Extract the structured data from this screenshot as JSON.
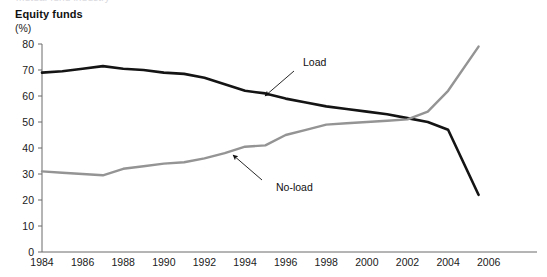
{
  "top_cut_text": "mutual fund industry",
  "chart_data": {
    "type": "line",
    "title": "Equity funds",
    "subtitle": "(%)",
    "unit_label": "(%)",
    "xlabel": "",
    "ylabel": "",
    "grid": false,
    "legend_position": "inline-annotation",
    "xlim": [
      1984,
      2007
    ],
    "ylim": [
      0,
      80
    ],
    "x_ticks": [
      1984,
      1986,
      1988,
      1990,
      1992,
      1994,
      1996,
      1998,
      2000,
      2002,
      2004,
      2006
    ],
    "x_tick_labels": [
      "1984",
      "1986",
      "1988",
      "1990",
      "1992",
      "1994",
      "1996",
      "1998",
      "2000",
      "2002",
      "2004",
      "2006"
    ],
    "y_ticks": [
      0,
      10,
      20,
      30,
      40,
      50,
      60,
      70,
      80
    ],
    "y_tick_labels": [
      "0",
      "10",
      "20",
      "30",
      "40",
      "50",
      "60",
      "70",
      "80"
    ],
    "x": [
      1984,
      1985,
      1986,
      1987,
      1988,
      1989,
      1990,
      1991,
      1992,
      1993,
      1994,
      1995,
      1996,
      1997,
      1998,
      1999,
      2000,
      2001,
      2002,
      2003,
      2004,
      2005.5
    ],
    "series": [
      {
        "name": "Load",
        "color": "#141414",
        "values": [
          69,
          69.5,
          70.5,
          71.5,
          70.5,
          70,
          69,
          68.5,
          67,
          64.5,
          62,
          61,
          59,
          57.5,
          56,
          55,
          54,
          53,
          51.5,
          50,
          47,
          22
        ]
      },
      {
        "name": "No-load",
        "color": "#949494",
        "values": [
          31,
          30.5,
          30,
          29.5,
          32,
          33,
          34,
          34.5,
          36,
          38,
          40.5,
          41,
          45,
          47,
          49,
          49.5,
          50,
          50.5,
          51,
          54,
          62,
          79
        ]
      }
    ],
    "annotations": [
      {
        "text": "Load",
        "target_series": "Load",
        "label_x": 303,
        "label_y": 66,
        "arrow_from_x": 294,
        "arrow_from_y": 71,
        "arrow_to_x": 265,
        "arrow_to_y": 96
      },
      {
        "text": "No-load",
        "target_series": "No-load",
        "label_x": 276,
        "label_y": 191,
        "arrow_from_x": 262,
        "arrow_from_y": 180,
        "arrow_to_x": 233,
        "arrow_to_y": 155
      }
    ]
  }
}
